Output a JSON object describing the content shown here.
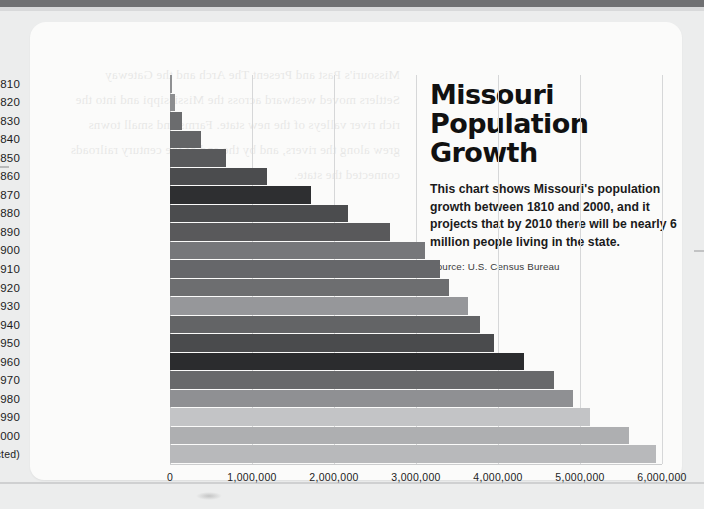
{
  "page": {
    "background_color": "#eceded",
    "card_color": "#fbfbfa",
    "bleed_text": "Missouri's Past and Present The Arch and the Gateway Settlers moved westward across the Mississippi and into the rich river valleys of the new state. Farms and small towns grew along the rivers, and by the end of the century railroads connected the state."
  },
  "header": {
    "title_line1": "Missouri",
    "title_line2": "Population Growth",
    "description": "This chart shows Missouri's population growth between 1810 and 2000, and it projects that by 2010 there will be nearly 6 million people living in the state.",
    "source": "Source: U.S. Census Bureau"
  },
  "chart_data": {
    "type": "bar",
    "orientation": "horizontal",
    "title": "Missouri Population Growth",
    "subtitle": "This chart shows Missouri's population growth between 1810 and 2000, and it projects that by 2010 there will be nearly 6 million people living in the state.",
    "source": "Source: U.S. Census Bureau",
    "xlabel": "",
    "ylabel": "",
    "xlim": [
      0,
      6000000
    ],
    "ylim": null,
    "grid": true,
    "grid_axis": "x",
    "legend": false,
    "xticks": [
      0,
      1000000,
      2000000,
      3000000,
      4000000,
      5000000,
      6000000
    ],
    "xtick_labels": [
      "0",
      "1,000,000",
      "2,000,000",
      "3,000,000",
      "4,000,000",
      "5,000,000",
      "6,000,000"
    ],
    "categories": [
      "1810",
      "1820",
      "1830",
      "1840",
      "1850",
      "1860",
      "1870",
      "1880",
      "1890",
      "1900",
      "1910",
      "1920",
      "1930",
      "1940",
      "1950",
      "1960",
      "1970",
      "1980",
      "1990",
      "2000",
      "2010 (projected)"
    ],
    "values": [
      20845,
      66586,
      140455,
      383702,
      682044,
      1182012,
      1721295,
      2168380,
      2679185,
      3106665,
      3293335,
      3404055,
      3629367,
      3784664,
      3954653,
      4319813,
      4677623,
      4916686,
      5117073,
      5595211,
      5922000
    ],
    "bar_colors": [
      "#8f9092",
      "#8d8e90",
      "#6b6c6e",
      "#636466",
      "#58595b",
      "#4b4c4e",
      "#2e2f31",
      "#4b4c4e",
      "#59595b",
      "#76777a",
      "#66676a",
      "#6d6e70",
      "#96979a",
      "#636466",
      "#4a4b4d",
      "#2b2c2e",
      "#68696b",
      "#8f9093",
      "#c3c4c6",
      "#aeafb1",
      "#b8b9bb",
      "#a9aaac",
      "#9d9ea0",
      "#8d8e90",
      "#7e7f81",
      "#727375"
    ]
  }
}
